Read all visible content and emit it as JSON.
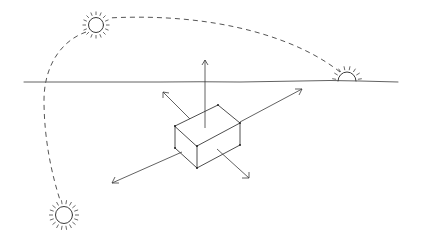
{
  "title": "",
  "diagram": {
    "colors": {
      "ink": "#3a3a3a",
      "background": "#ffffff"
    },
    "elements": [
      {
        "id": "sun-top",
        "kind": "sun",
        "label": ""
      },
      {
        "id": "sun-setting",
        "kind": "half-sun-on-horizon",
        "label": ""
      },
      {
        "id": "sun-bottom",
        "kind": "sun",
        "label": ""
      },
      {
        "id": "sun-path",
        "kind": "dashed-arc",
        "label": ""
      },
      {
        "id": "horizon",
        "kind": "line",
        "label": ""
      },
      {
        "id": "box",
        "kind": "3d-box",
        "label": ""
      },
      {
        "id": "arrows",
        "kind": "axis-arrows",
        "count": 5
      }
    ]
  }
}
